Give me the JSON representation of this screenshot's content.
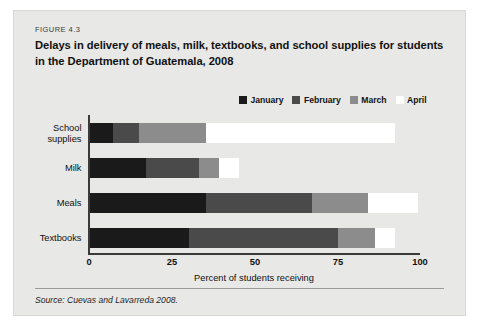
{
  "figure": {
    "number": "FIGURE 4.3",
    "title": "Delays in delivery of meals, milk, textbooks, and school supplies for students in the Department of Guatemala, 2008",
    "source": "Source: Cuevas and Lavarreda 2008."
  },
  "chart_data": {
    "type": "bar",
    "orientation": "horizontal",
    "stacked": true,
    "title": "Delays in delivery of meals, milk, textbooks, and school supplies for students in the Department of Guatemala, 2008",
    "xlabel": "Percent of students receiving",
    "ylabel": "",
    "xlim": [
      0,
      100
    ],
    "xticks": [
      0,
      25,
      50,
      75,
      100
    ],
    "grid": false,
    "legend_position": "top-right",
    "categories": [
      "School supplies",
      "Milk",
      "Meals",
      "Textbooks"
    ],
    "series": [
      {
        "name": "January",
        "color": "#1a1a1a",
        "values": [
          7,
          17,
          35,
          30
        ]
      },
      {
        "name": "February",
        "color": "#4a4a4a",
        "values": [
          8,
          16,
          32,
          45
        ]
      },
      {
        "name": "March",
        "color": "#8c8c8c",
        "values": [
          20,
          6,
          17,
          11
        ]
      },
      {
        "name": "April",
        "color": "#ffffff",
        "values": [
          57,
          6,
          15,
          6
        ]
      }
    ],
    "cumulative_totals": [
      92,
      45,
      99,
      92
    ]
  },
  "legend": {
    "items": [
      {
        "label": "January",
        "color": "#1a1a1a"
      },
      {
        "label": "February",
        "color": "#4a4a4a"
      },
      {
        "label": "March",
        "color": "#8c8c8c"
      },
      {
        "label": "April",
        "color": "#ffffff"
      }
    ]
  },
  "axis": {
    "x_tick_labels": [
      "0",
      "25",
      "50",
      "75",
      "100"
    ],
    "x_title": "Percent of students receiving",
    "y_tick_labels": [
      "School supplies",
      "Milk",
      "Meals",
      "Textbooks"
    ]
  }
}
